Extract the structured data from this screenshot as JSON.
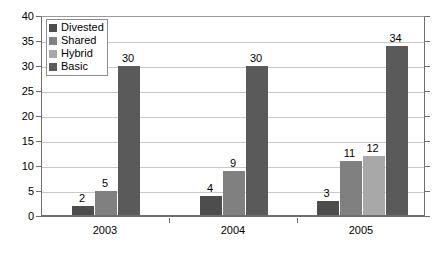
{
  "chart_data": {
    "type": "bar",
    "title": "",
    "subtitle": "",
    "xlabel": "",
    "ylabel": "",
    "categories": [
      "2003",
      "2004",
      "2005"
    ],
    "series": [
      {
        "name": "Divested",
        "color": "#4d4d4d",
        "values": [
          2,
          4,
          3
        ]
      },
      {
        "name": "Shared",
        "color": "#808080",
        "values": [
          5,
          9,
          11
        ]
      },
      {
        "name": "Hybrid",
        "color": "#a8a8a8",
        "values": [
          0,
          0,
          12
        ]
      },
      {
        "name": "Basic",
        "color": "#5a5a5a",
        "values": [
          30,
          30,
          34
        ]
      }
    ],
    "ylim": [
      0,
      40
    ],
    "ytick_step": 5,
    "yticks": [
      "0",
      "5",
      "10",
      "15",
      "20",
      "25",
      "30",
      "35",
      "40"
    ],
    "grid": true,
    "grid_axis": "y",
    "legend_position": "top-left-inside",
    "data_labels": true,
    "data_labels_hide_zero": true
  },
  "legend": {
    "items": [
      {
        "label": "Divested"
      },
      {
        "label": "Shared"
      },
      {
        "label": "Hybrid"
      },
      {
        "label": "Basic"
      }
    ]
  }
}
